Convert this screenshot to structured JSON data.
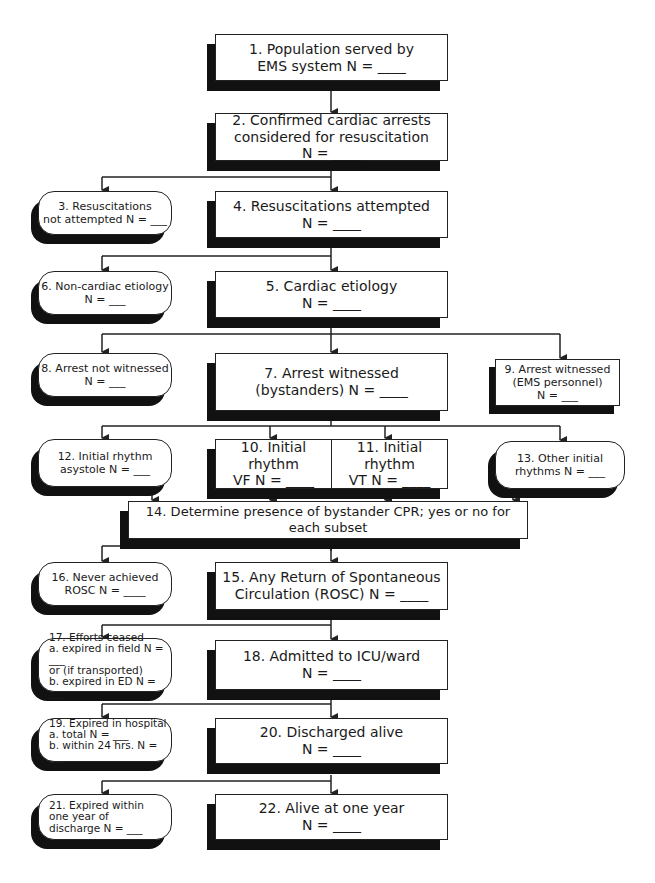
{
  "diagram": {
    "nodes": [
      {
        "id": "1",
        "text": "1. Population served by\nEMS system  N = ____"
      },
      {
        "id": "2",
        "text": "2. Confirmed cardiac arrests\nconsidered for resuscitation\nN = ____"
      },
      {
        "id": "3",
        "text": "3. Resuscitations\n   not attempted  N = ___"
      },
      {
        "id": "4",
        "text": "4. Resuscitations attempted\nN = ____"
      },
      {
        "id": "5",
        "text": "5. Cardiac etiology\nN = ____"
      },
      {
        "id": "6",
        "text": "6. Non-cardiac etiology\nN = ___"
      },
      {
        "id": "7",
        "text": "7. Arrest witnessed\n   (bystanders)  N = ____"
      },
      {
        "id": "8",
        "text": "8. Arrest not witnessed\nN = ___"
      },
      {
        "id": "9",
        "text": "9. Arrest witnessed\n(EMS personnel)\nN = ___"
      },
      {
        "id": "10",
        "text": "10. Initial rhythm\nVF N = ____"
      },
      {
        "id": "11",
        "text": "11. Initial rhythm\nVT N = ____"
      },
      {
        "id": "12",
        "text": "12. Initial rhythm\n   asystole  N = ___"
      },
      {
        "id": "13",
        "text": "13. Other initial\n   rhythms N = ___"
      },
      {
        "id": "14",
        "text": "14. Determine presence of bystander CPR; yes or no for each subset"
      },
      {
        "id": "15",
        "text": "15. Any Return of Spontaneous\n   Circulation (ROSC)  N = ____"
      },
      {
        "id": "16",
        "text": "16. Never achieved\n   ROSC  N = ____"
      },
      {
        "id": "17",
        "text": "17. Efforts ceased\na. expired in field  N = ___\nor (if transported)\nb. expired in ED  N = ___"
      },
      {
        "id": "18",
        "text": "18. Admitted to ICU/ward\nN = ____"
      },
      {
        "id": "19",
        "text": "19. Expired in hospital\na. total  N = ___\nb. within 24 hrs.  N = ___"
      },
      {
        "id": "20",
        "text": "20. Discharged alive\nN = ____"
      },
      {
        "id": "21",
        "text": "21. Expired within\n    one year of\n    discharge  N = ___"
      },
      {
        "id": "22",
        "text": "22. Alive at one year\nN = ____"
      }
    ]
  }
}
